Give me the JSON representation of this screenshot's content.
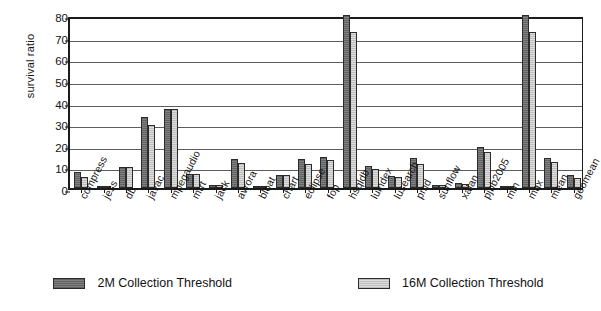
{
  "chart_data": {
    "type": "bar",
    "title": "",
    "xlabel": "",
    "ylabel": "survival ratio",
    "ylim": [
      0,
      80
    ],
    "ytick_values": [
      0,
      10,
      20,
      30,
      40,
      50,
      60,
      70,
      80
    ],
    "ytick_labels": [
      "0",
      "10",
      "20",
      "30",
      "40",
      "50",
      "60",
      "70",
      "80"
    ],
    "grid": "horizontal",
    "legend_position": "bottom",
    "categories": [
      "compress",
      "jess",
      "db",
      "javac",
      "mpegaudio",
      "mtrt",
      "jack",
      "avrora",
      "bloat",
      "chart",
      "eclipse",
      "fop",
      "hsqldb",
      "luindex",
      "lusearch",
      "pmd",
      "sunflow",
      "xalan",
      "pjbb2005",
      "min",
      "max",
      "mean",
      "geomean"
    ],
    "series": [
      {
        "name": "2M Collection Threshold",
        "color": "#7a7a7a",
        "values": [
          7.2,
          0.8,
          9.5,
          33.0,
          36.5,
          6.5,
          1.6,
          13.2,
          1.0,
          6.0,
          13.2,
          14.5,
          80.0,
          10.0,
          5.5,
          13.8,
          1.5,
          2.2,
          19.0,
          0.6,
          80.0,
          13.8,
          6.2
        ]
      },
      {
        "name": "16M Collection Threshold",
        "color": "#d3d3d3",
        "values": [
          5.0,
          0.8,
          9.6,
          29.2,
          36.5,
          6.4,
          1.6,
          11.5,
          0.7,
          5.8,
          11.0,
          13.0,
          72.2,
          8.8,
          5.0,
          11.0,
          1.2,
          2.0,
          16.8,
          0.4,
          72.0,
          11.8,
          4.8
        ]
      }
    ]
  },
  "legend": {
    "items": [
      {
        "label": "2M Collection Threshold",
        "swatch": "dark-gray"
      },
      {
        "label": "16M Collection Threshold",
        "swatch": "light-gray"
      }
    ]
  }
}
